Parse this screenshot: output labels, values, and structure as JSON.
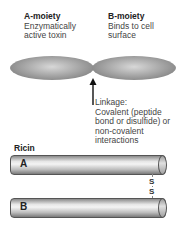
{
  "a_moiety": {
    "title": "A-moiety",
    "line1": "Enzymatically",
    "line2": "active toxin"
  },
  "b_moiety": {
    "title": "B-moiety",
    "line1": "Binds to cell",
    "line2": "surface"
  },
  "linkage": {
    "lines": [
      "Linkage:",
      "Covalent (peptide",
      "bond or disulfide) or",
      "non-covalent",
      "interactions"
    ]
  },
  "ricin": {
    "title": "Ricin",
    "chain_a": "A",
    "chain_b": "B",
    "bond_top": "S",
    "bond_bottom": "S"
  }
}
